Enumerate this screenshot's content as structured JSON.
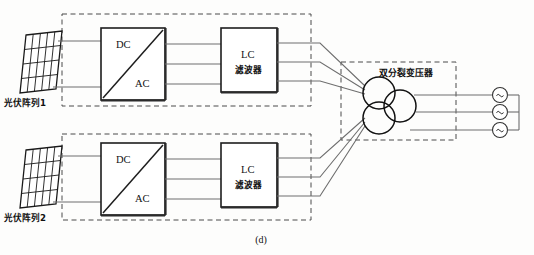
{
  "figure": {
    "caption": "(d)",
    "title_alt": "光伏发电系统双分裂变压器并网结构图"
  },
  "pv_arrays": [
    {
      "id": "pv1",
      "label": "光伏阵列1"
    },
    {
      "id": "pv2",
      "label": "光伏阵列2"
    }
  ],
  "inverters": [
    {
      "id": "inv1",
      "input_label": "DC",
      "output_label": "AC"
    },
    {
      "id": "inv2",
      "input_label": "DC",
      "output_label": "AC"
    }
  ],
  "filters": [
    {
      "id": "lc1",
      "line1": "LC",
      "line2": "滤波器"
    },
    {
      "id": "lc2",
      "line1": "LC",
      "line2": "滤波器"
    }
  ],
  "transformer": {
    "label": "双分裂变压器",
    "winding_count": 3,
    "topology": "double-split"
  },
  "grid_sources": [
    {
      "id": "src-a",
      "symbol": "~"
    },
    {
      "id": "src-b",
      "symbol": "~"
    },
    {
      "id": "src-c",
      "symbol": "~"
    }
  ],
  "colors": {
    "wire": "#6e6e6e",
    "outline": "#1d1d1d",
    "dashed": "#4a4a4a",
    "background": "#fdfdfc"
  }
}
